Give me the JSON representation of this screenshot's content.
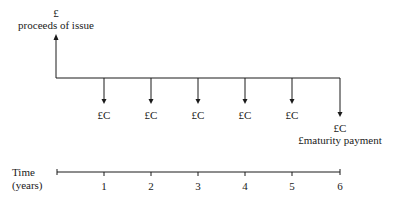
{
  "diagram": {
    "issue": {
      "currency_symbol": "£",
      "label": "proceeds of issue"
    },
    "coupon_label": "£C",
    "coupons": [
      {
        "year": 1,
        "label": "£C"
      },
      {
        "year": 2,
        "label": "£C"
      },
      {
        "year": 3,
        "label": "£C"
      },
      {
        "year": 4,
        "label": "£C"
      },
      {
        "year": 5,
        "label": "£C"
      }
    ],
    "final": {
      "year": 6,
      "coupon_label": "£C",
      "maturity_label": "£maturity payment"
    },
    "time_axis": {
      "label_line1": "Time",
      "label_line2": "(years)",
      "ticks": [
        "1",
        "2",
        "3",
        "4",
        "5",
        "6"
      ]
    },
    "colors": {
      "line": "#1a1a1a",
      "background": "#ffffff"
    }
  }
}
